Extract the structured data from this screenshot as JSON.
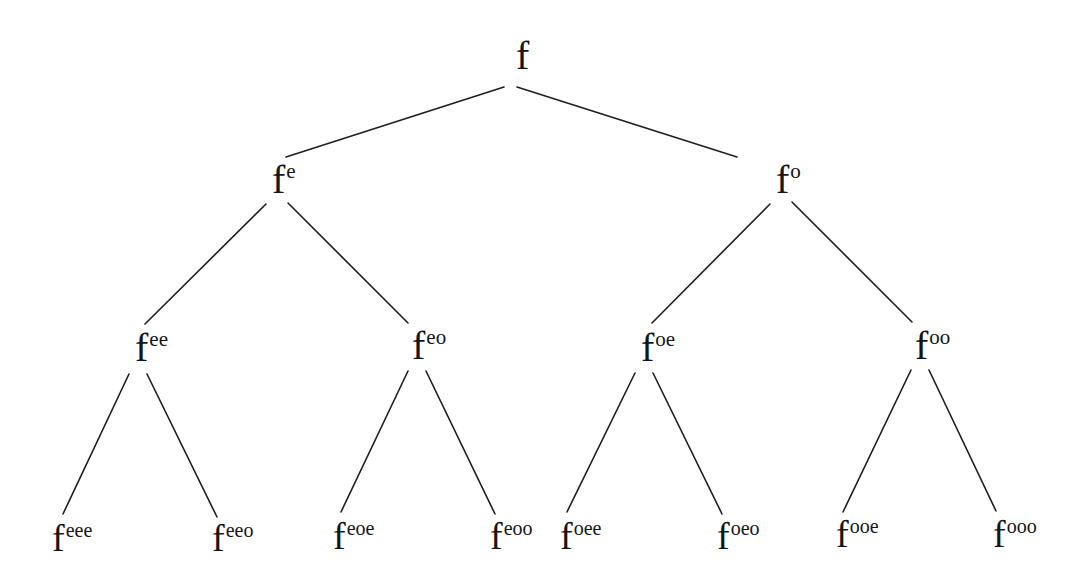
{
  "diagram": {
    "type": "binary-tree",
    "nodes": {
      "root": {
        "base": "f",
        "sup": "",
        "x": 516,
        "y": 36
      },
      "e": {
        "base": "f",
        "sup": "e",
        "x": 272,
        "y": 160
      },
      "o": {
        "base": "f",
        "sup": "o",
        "x": 776,
        "y": 160
      },
      "ee": {
        "base": "f",
        "sup": "ee",
        "x": 135,
        "y": 328
      },
      "eo": {
        "base": "f",
        "sup": "eo",
        "x": 412,
        "y": 326
      },
      "oe": {
        "base": "f",
        "sup": "oe",
        "x": 641,
        "y": 328
      },
      "oo": {
        "base": "f",
        "sup": "oo",
        "x": 915,
        "y": 326
      },
      "eee": {
        "base": "f",
        "sup": "eee",
        "x": 52,
        "y": 519
      },
      "eeo": {
        "base": "f",
        "sup": "eeo",
        "x": 212,
        "y": 519
      },
      "eoe": {
        "base": "f",
        "sup": "eoe",
        "x": 333,
        "y": 517
      },
      "eoo": {
        "base": "f",
        "sup": "eoo",
        "x": 490,
        "y": 517
      },
      "oee": {
        "base": "f",
        "sup": "oee",
        "x": 560,
        "y": 517
      },
      "oeo": {
        "base": "f",
        "sup": "oeo",
        "x": 717,
        "y": 517
      },
      "ooe": {
        "base": "f",
        "sup": "ooe",
        "x": 836,
        "y": 515
      },
      "ooo": {
        "base": "f",
        "sup": "ooo",
        "x": 993,
        "y": 515
      }
    },
    "edges": [
      {
        "from": "root",
        "to": "e",
        "x1": 504,
        "y1": 87,
        "x2": 286,
        "y2": 157
      },
      {
        "from": "root",
        "to": "o",
        "x1": 517,
        "y1": 87,
        "x2": 737,
        "y2": 157
      },
      {
        "from": "e",
        "to": "ee",
        "x1": 266,
        "y1": 204,
        "x2": 145,
        "y2": 324
      },
      {
        "from": "e",
        "to": "eo",
        "x1": 288,
        "y1": 203,
        "x2": 408,
        "y2": 323
      },
      {
        "from": "o",
        "to": "oe",
        "x1": 770,
        "y1": 204,
        "x2": 652,
        "y2": 323
      },
      {
        "from": "o",
        "to": "oo",
        "x1": 792,
        "y1": 202,
        "x2": 912,
        "y2": 322
      },
      {
        "from": "ee",
        "to": "eee",
        "x1": 129,
        "y1": 374,
        "x2": 63,
        "y2": 514
      },
      {
        "from": "ee",
        "to": "eeo",
        "x1": 147,
        "y1": 374,
        "x2": 217,
        "y2": 517
      },
      {
        "from": "eo",
        "to": "eoe",
        "x1": 408,
        "y1": 371,
        "x2": 341,
        "y2": 512
      },
      {
        "from": "eo",
        "to": "eoo",
        "x1": 426,
        "y1": 371,
        "x2": 495,
        "y2": 514
      },
      {
        "from": "oe",
        "to": "oee",
        "x1": 635,
        "y1": 373,
        "x2": 567,
        "y2": 512
      },
      {
        "from": "oe",
        "to": "oeo",
        "x1": 653,
        "y1": 373,
        "x2": 722,
        "y2": 514
      },
      {
        "from": "oo",
        "to": "ooe",
        "x1": 911,
        "y1": 370,
        "x2": 843,
        "y2": 512
      },
      {
        "from": "oo",
        "to": "ooo",
        "x1": 929,
        "y1": 370,
        "x2": 996,
        "y2": 511
      }
    ],
    "colors": {
      "ink": "#151515",
      "line": "#1e1e1e",
      "background": "#ffffff"
    }
  }
}
